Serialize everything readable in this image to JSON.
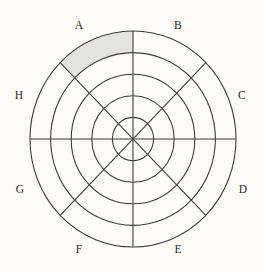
{
  "figure": {
    "kind": "polar-sector-diagram",
    "background_color": "#fdfcf8",
    "stroke_color": "#3d3d3d",
    "highlight_color": "#e3e3e1"
  },
  "chart_data": {
    "type": "pie",
    "title": "",
    "xlabel": "",
    "ylabel": "",
    "grid": true,
    "legend": "none",
    "geometry": {
      "center_x": 133,
      "center_y": 139,
      "radius_x": 103,
      "radius_y": 108,
      "ring_count": 5,
      "sector_count": 8,
      "sector_angle_degrees": 45,
      "ring_radii_fraction": [
        0.2,
        0.4,
        0.6,
        0.8,
        1.0
      ]
    },
    "categories": [
      "A",
      "B",
      "C",
      "D",
      "E",
      "F",
      "G",
      "H"
    ],
    "values": [
      1,
      0,
      0,
      0,
      0,
      0,
      0,
      0
    ],
    "highlighted": {
      "sector": "A",
      "ring_band": 5,
      "band_inner_fraction": 0.8,
      "band_outer_fraction": 1.0,
      "start_angle_degrees": 90,
      "end_angle_degrees": 135
    },
    "sectors": [
      {
        "id": "A",
        "label": "A",
        "start_angle_degrees": 90,
        "end_angle_degrees": 135,
        "shaded": true,
        "label_x": 79,
        "label_y": 26
      },
      {
        "id": "B",
        "label": "B",
        "start_angle_degrees": 45,
        "end_angle_degrees": 90,
        "shaded": false,
        "label_x": 178,
        "label_y": 26
      },
      {
        "id": "C",
        "label": "C",
        "start_angle_degrees": 0,
        "end_angle_degrees": 45,
        "shaded": false,
        "label_x": 242,
        "label_y": 96
      },
      {
        "id": "D",
        "label": "D",
        "start_angle_degrees": 315,
        "end_angle_degrees": 360,
        "shaded": false,
        "label_x": 243,
        "label_y": 190
      },
      {
        "id": "E",
        "label": "E",
        "start_angle_degrees": 270,
        "end_angle_degrees": 315,
        "shaded": false,
        "label_x": 178,
        "label_y": 250
      },
      {
        "id": "F",
        "label": "F",
        "start_angle_degrees": 225,
        "end_angle_degrees": 270,
        "shaded": false,
        "label_x": 79,
        "label_y": 250
      },
      {
        "id": "G",
        "label": "G",
        "start_angle_degrees": 180,
        "end_angle_degrees": 225,
        "shaded": false,
        "label_x": 20,
        "label_y": 190
      },
      {
        "id": "H",
        "label": "H",
        "start_angle_degrees": 135,
        "end_angle_degrees": 180,
        "shaded": false,
        "label_x": 19,
        "label_y": 96
      }
    ],
    "rings": [
      {
        "index": 1,
        "fraction": 0.2
      },
      {
        "index": 2,
        "fraction": 0.4
      },
      {
        "index": 3,
        "fraction": 0.6
      },
      {
        "index": 4,
        "fraction": 0.8
      },
      {
        "index": 5,
        "fraction": 1.0
      }
    ]
  }
}
